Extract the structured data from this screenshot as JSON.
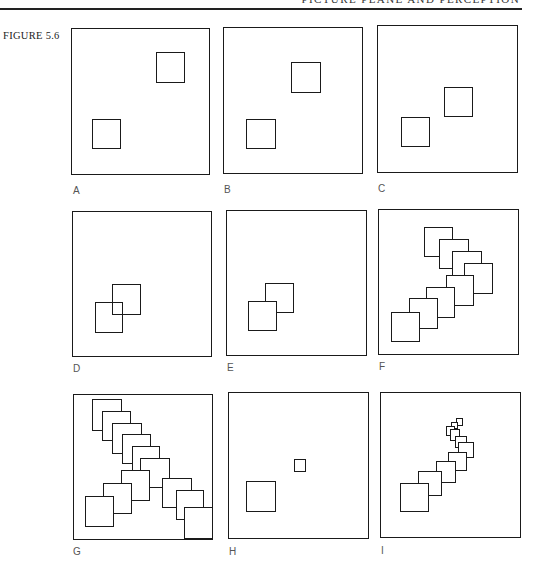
{
  "page": {
    "running_head": "PICTURE PLANE AND PERCEPTION",
    "figure_label": "FIGURE 5.6"
  },
  "panels": [
    {
      "id": "A",
      "label": "A",
      "box": [
        71,
        28,
        139,
        147
      ],
      "label_pos": [
        73,
        185
      ],
      "squares": [
        {
          "x": 93,
          "y": 120,
          "w": 29,
          "h": 30,
          "style": "opaque"
        },
        {
          "x": 157,
          "y": 53,
          "w": 29,
          "h": 31,
          "style": "opaque"
        }
      ]
    },
    {
      "id": "B",
      "label": "B",
      "box": [
        223,
        27,
        140,
        147
      ],
      "label_pos": [
        224,
        184
      ],
      "squares": [
        {
          "x": 247,
          "y": 120,
          "w": 30,
          "h": 30,
          "style": "opaque"
        },
        {
          "x": 292,
          "y": 63,
          "w": 30,
          "h": 31,
          "style": "opaque"
        }
      ]
    },
    {
      "id": "C",
      "label": "C",
      "box": [
        377,
        25,
        141,
        148
      ],
      "label_pos": [
        378,
        183
      ],
      "squares": [
        {
          "x": 402,
          "y": 118,
          "w": 29,
          "h": 30,
          "style": "opaque"
        },
        {
          "x": 445,
          "y": 88,
          "w": 29,
          "h": 30,
          "style": "opaque"
        }
      ]
    },
    {
      "id": "D",
      "label": "D",
      "box": [
        72,
        211,
        140,
        146
      ],
      "label_pos": [
        73,
        363
      ],
      "squares": [
        {
          "x": 113,
          "y": 285,
          "w": 29,
          "h": 31,
          "style": "clear"
        },
        {
          "x": 96,
          "y": 303,
          "w": 28,
          "h": 31,
          "style": "clear"
        }
      ]
    },
    {
      "id": "E",
      "label": "E",
      "box": [
        226,
        210,
        141,
        146
      ],
      "label_pos": [
        227,
        362
      ],
      "squares": [
        {
          "x": 266,
          "y": 284,
          "w": 29,
          "h": 30,
          "style": "opaque"
        },
        {
          "x": 249,
          "y": 302,
          "w": 29,
          "h": 30,
          "style": "opaque"
        }
      ]
    },
    {
      "id": "F",
      "label": "F",
      "box": [
        378,
        209,
        141,
        146
      ],
      "label_pos": [
        379,
        361
      ],
      "squares": [
        {
          "x": 425,
          "y": 228,
          "w": 29,
          "h": 30,
          "style": "opaque"
        },
        {
          "x": 440,
          "y": 240,
          "w": 30,
          "h": 30,
          "style": "opaque"
        },
        {
          "x": 453,
          "y": 252,
          "w": 30,
          "h": 30,
          "style": "opaque"
        },
        {
          "x": 465,
          "y": 264,
          "w": 29,
          "h": 31,
          "style": "opaque"
        },
        {
          "x": 447,
          "y": 276,
          "w": 28,
          "h": 31,
          "style": "opaque"
        },
        {
          "x": 427,
          "y": 288,
          "w": 29,
          "h": 31,
          "style": "opaque"
        },
        {
          "x": 410,
          "y": 299,
          "w": 29,
          "h": 31,
          "style": "opaque"
        },
        {
          "x": 392,
          "y": 313,
          "w": 29,
          "h": 30,
          "style": "opaque"
        }
      ]
    },
    {
      "id": "G",
      "label": "G",
      "box": [
        73,
        394,
        140,
        146
      ],
      "label_pos": [
        73,
        546
      ],
      "squares": [
        {
          "x": 93,
          "y": 400,
          "w": 30,
          "h": 32,
          "style": "opaque"
        },
        {
          "x": 103,
          "y": 412,
          "w": 29,
          "h": 30,
          "style": "opaque"
        },
        {
          "x": 113,
          "y": 424,
          "w": 30,
          "h": 31,
          "style": "opaque"
        },
        {
          "x": 123,
          "y": 435,
          "w": 29,
          "h": 30,
          "style": "opaque"
        },
        {
          "x": 133,
          "y": 447,
          "w": 28,
          "h": 30,
          "style": "opaque"
        },
        {
          "x": 141,
          "y": 459,
          "w": 30,
          "h": 30,
          "style": "opaque"
        },
        {
          "x": 163,
          "y": 479,
          "w": 30,
          "h": 30,
          "style": "opaque"
        },
        {
          "x": 177,
          "y": 491,
          "w": 28,
          "h": 30,
          "style": "opaque"
        },
        {
          "x": 185,
          "y": 508,
          "w": 30,
          "h": 32,
          "style": "opaque"
        },
        {
          "x": 122,
          "y": 471,
          "w": 29,
          "h": 31,
          "style": "opaque"
        },
        {
          "x": 104,
          "y": 484,
          "w": 29,
          "h": 31,
          "style": "opaque"
        },
        {
          "x": 86,
          "y": 497,
          "w": 29,
          "h": 31,
          "style": "opaque"
        }
      ]
    },
    {
      "id": "H",
      "label": "H",
      "box": [
        228,
        392,
        141,
        147
      ],
      "label_pos": [
        229,
        546
      ],
      "squares": [
        {
          "x": 247,
          "y": 482,
          "w": 30,
          "h": 31,
          "style": "opaque"
        },
        {
          "x": 295,
          "y": 460,
          "w": 12,
          "h": 13,
          "style": "opaque"
        }
      ]
    },
    {
      "id": "I",
      "label": "I",
      "box": [
        380,
        392,
        141,
        146
      ],
      "label_pos": [
        381,
        545
      ],
      "squares": [
        {
          "x": 457,
          "y": 419,
          "w": 7,
          "h": 8,
          "style": "opaque"
        },
        {
          "x": 452,
          "y": 423,
          "w": 7,
          "h": 7,
          "style": "opaque"
        },
        {
          "x": 447,
          "y": 427,
          "w": 9,
          "h": 10,
          "style": "opaque"
        },
        {
          "x": 451,
          "y": 430,
          "w": 10,
          "h": 12,
          "style": "opaque"
        },
        {
          "x": 456,
          "y": 437,
          "w": 12,
          "h": 12,
          "style": "opaque"
        },
        {
          "x": 459,
          "y": 443,
          "w": 16,
          "h": 16,
          "style": "opaque"
        },
        {
          "x": 449,
          "y": 453,
          "w": 19,
          "h": 19,
          "style": "opaque"
        },
        {
          "x": 437,
          "y": 462,
          "w": 20,
          "h": 22,
          "style": "opaque"
        },
        {
          "x": 419,
          "y": 472,
          "w": 24,
          "h": 25,
          "style": "opaque"
        },
        {
          "x": 401,
          "y": 484,
          "w": 29,
          "h": 29,
          "style": "opaque"
        }
      ]
    }
  ]
}
